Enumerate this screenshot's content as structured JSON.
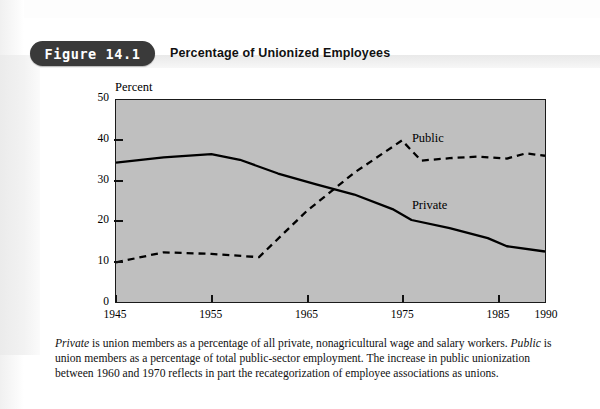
{
  "header": {
    "figure_badge": "Figure 14.1",
    "title": "Percentage of Unionized Employees"
  },
  "chart_data": {
    "type": "line",
    "title": "Percentage of Unionized Employees",
    "xlabel": "",
    "ylabel": "Percent",
    "ylim": [
      0,
      50
    ],
    "xlim": [
      1945,
      1990
    ],
    "yticks": [
      0,
      10,
      20,
      30,
      40,
      50
    ],
    "xticks": [
      1945,
      1955,
      1965,
      1975,
      1985,
      1990
    ],
    "grid": false,
    "legend_position": "inline-annotation",
    "background": "#bfbfbf",
    "series": [
      {
        "name": "Private",
        "style": "solid",
        "color": "#000000",
        "x": [
          1945,
          1950,
          1955,
          1958,
          1962,
          1966,
          1970,
          1974,
          1976,
          1980,
          1984,
          1986,
          1990
        ],
        "values": [
          34.5,
          35.8,
          36.6,
          35.2,
          31.8,
          29.1,
          26.6,
          23.0,
          20.3,
          18.3,
          15.8,
          13.8,
          12.5
        ]
      },
      {
        "name": "Public",
        "style": "dashed",
        "color": "#000000",
        "x": [
          1945,
          1950,
          1955,
          1960,
          1965,
          1970,
          1975,
          1977,
          1980,
          1983,
          1986,
          1988,
          1990
        ],
        "values": [
          9.8,
          12.3,
          11.9,
          11.1,
          22.5,
          32.0,
          40.0,
          35.0,
          35.6,
          36.0,
          35.5,
          36.8,
          36.2
        ]
      }
    ],
    "annotations": [
      {
        "text": "Public",
        "x": 1976,
        "y": 40.0
      },
      {
        "text": "Private",
        "x": 1976,
        "y": 23.5
      }
    ]
  },
  "caption": {
    "line1_em": "Private",
    "line1_rest": " is union members as a percentage of all private, nonagricultural wage and salary workers. ",
    "line2_em": "Public",
    "line2_rest": " is union members as a percentage of total public-sector employment. The increase in public unionization between 1960 and 1970 reflects in part the recategorization of employee associations as unions."
  }
}
